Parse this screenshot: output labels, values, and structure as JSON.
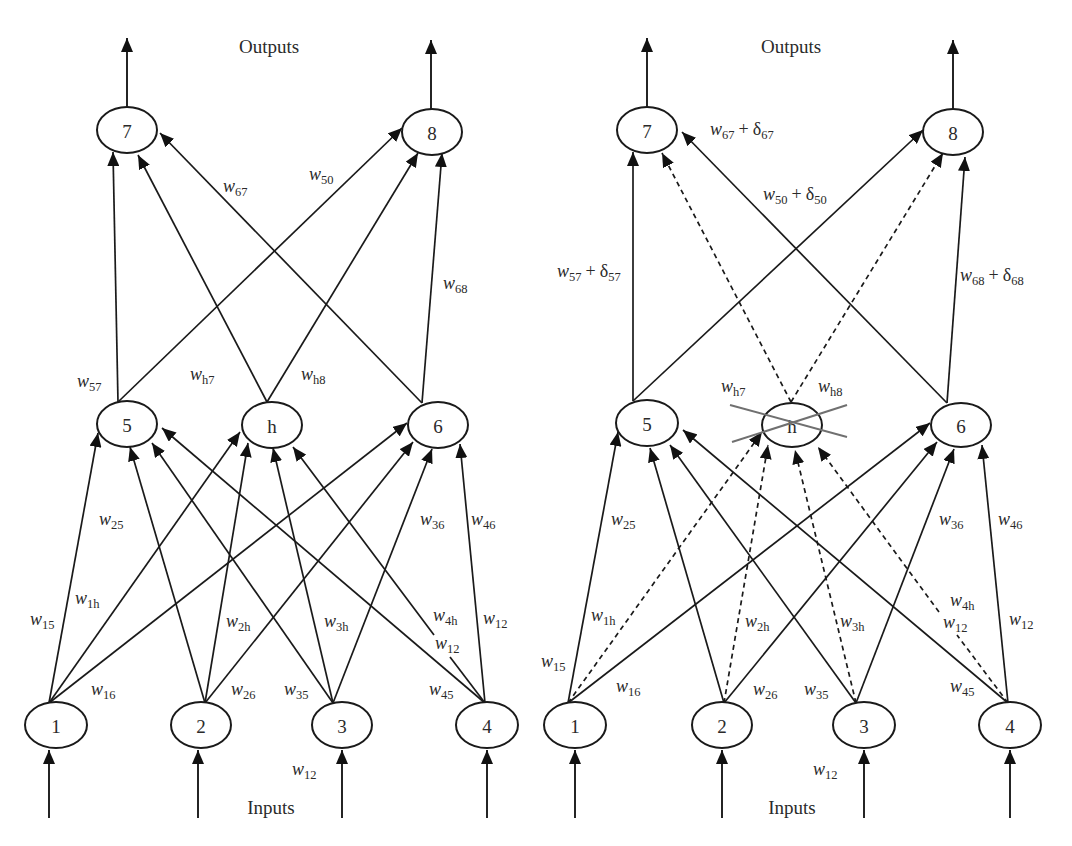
{
  "left": {
    "outputs_label": "Outputs",
    "inputs_label": "Inputs",
    "nodes": {
      "7": "7",
      "8": "8",
      "5": "5",
      "h": "h",
      "6": "6",
      "1": "1",
      "2": "2",
      "3": "3",
      "4": "4"
    },
    "weights": {
      "w67": {
        "v": "w",
        "s": "67"
      },
      "w50": {
        "v": "w",
        "s": "50"
      },
      "w68": {
        "v": "w",
        "s": "68"
      },
      "w57": {
        "v": "w",
        "s": "57"
      },
      "wh7": {
        "v": "w",
        "s": "h7"
      },
      "wh8": {
        "v": "w",
        "s": "h8"
      },
      "w25": {
        "v": "w",
        "s": "25"
      },
      "w36": {
        "v": "w",
        "s": "36"
      },
      "w46": {
        "v": "w",
        "s": "46"
      },
      "w1h": {
        "v": "w",
        "s": "1h"
      },
      "w15": {
        "v": "w",
        "s": "15"
      },
      "w2h": {
        "v": "w",
        "s": "2h"
      },
      "w3h": {
        "v": "w",
        "s": "3h"
      },
      "w4h": {
        "v": "w",
        "s": "4h"
      },
      "w12_a": {
        "v": "w",
        "s": "12"
      },
      "w12_b": {
        "v": "w",
        "s": "12"
      },
      "w16": {
        "v": "w",
        "s": "16"
      },
      "w26": {
        "v": "w",
        "s": "26"
      },
      "w35": {
        "v": "w",
        "s": "35"
      },
      "w45": {
        "v": "w",
        "s": "45"
      },
      "w12_c": {
        "v": "w",
        "s": "12"
      }
    },
    "edges": [
      {
        "from": "1",
        "to": "5",
        "style": "solid"
      },
      {
        "from": "1",
        "to": "h",
        "style": "solid"
      },
      {
        "from": "1",
        "to": "6",
        "style": "solid"
      },
      {
        "from": "2",
        "to": "5",
        "style": "solid"
      },
      {
        "from": "2",
        "to": "h",
        "style": "solid"
      },
      {
        "from": "2",
        "to": "6",
        "style": "solid"
      },
      {
        "from": "3",
        "to": "5",
        "style": "solid"
      },
      {
        "from": "3",
        "to": "h",
        "style": "solid"
      },
      {
        "from": "3",
        "to": "6",
        "style": "solid"
      },
      {
        "from": "4",
        "to": "5",
        "style": "solid"
      },
      {
        "from": "4",
        "to": "h",
        "style": "solid"
      },
      {
        "from": "4",
        "to": "6",
        "style": "solid"
      },
      {
        "from": "5",
        "to": "7",
        "style": "solid"
      },
      {
        "from": "5",
        "to": "8",
        "style": "solid"
      },
      {
        "from": "h",
        "to": "7",
        "style": "solid"
      },
      {
        "from": "h",
        "to": "8",
        "style": "solid"
      },
      {
        "from": "6",
        "to": "7",
        "style": "solid"
      },
      {
        "from": "6",
        "to": "8",
        "style": "solid"
      }
    ]
  },
  "right": {
    "outputs_label": "Outputs",
    "inputs_label": "Inputs",
    "pruned_node": "h",
    "cross_color": "#707070",
    "nodes": {
      "7": "7",
      "8": "8",
      "5": "5",
      "h": "h",
      "6": "6",
      "1": "1",
      "2": "2",
      "3": "3",
      "4": "4"
    },
    "weights": {
      "w67": {
        "v": "w",
        "s": "67",
        "op": "+",
        "d": "δ",
        "ds": "67"
      },
      "w50": {
        "v": "w",
        "s": "50",
        "op": "+",
        "d": "δ",
        "ds": "50"
      },
      "w57": {
        "v": "w",
        "s": "57",
        "op": "+",
        "d": "δ",
        "ds": "57"
      },
      "w68": {
        "v": "w",
        "s": "68",
        "op": "+",
        "d": "δ",
        "ds": "68"
      },
      "wh7": {
        "v": "w",
        "s": "h7"
      },
      "wh8": {
        "v": "w",
        "s": "h8"
      },
      "w25": {
        "v": "w",
        "s": "25"
      },
      "w36": {
        "v": "w",
        "s": "36"
      },
      "w46": {
        "v": "w",
        "s": "46"
      },
      "w1h": {
        "v": "w",
        "s": "1h"
      },
      "w15": {
        "v": "w",
        "s": "15"
      },
      "w2h": {
        "v": "w",
        "s": "2h"
      },
      "w3h": {
        "v": "w",
        "s": "3h"
      },
      "w4h": {
        "v": "w",
        "s": "4h"
      },
      "w12_a": {
        "v": "w",
        "s": "12"
      },
      "w12_b": {
        "v": "w",
        "s": "12"
      },
      "w16": {
        "v": "w",
        "s": "16"
      },
      "w26": {
        "v": "w",
        "s": "26"
      },
      "w35": {
        "v": "w",
        "s": "35"
      },
      "w45": {
        "v": "w",
        "s": "45"
      },
      "w12_c": {
        "v": "w",
        "s": "12"
      }
    },
    "edges": [
      {
        "from": "1",
        "to": "5",
        "style": "solid"
      },
      {
        "from": "1",
        "to": "h",
        "style": "dashed"
      },
      {
        "from": "1",
        "to": "6",
        "style": "solid"
      },
      {
        "from": "2",
        "to": "5",
        "style": "solid"
      },
      {
        "from": "2",
        "to": "h",
        "style": "dashed"
      },
      {
        "from": "2",
        "to": "6",
        "style": "solid"
      },
      {
        "from": "3",
        "to": "5",
        "style": "solid"
      },
      {
        "from": "3",
        "to": "h",
        "style": "dashed"
      },
      {
        "from": "3",
        "to": "6",
        "style": "solid"
      },
      {
        "from": "4",
        "to": "5",
        "style": "solid"
      },
      {
        "from": "4",
        "to": "h",
        "style": "dashed"
      },
      {
        "from": "4",
        "to": "6",
        "style": "solid"
      },
      {
        "from": "5",
        "to": "7",
        "style": "solid"
      },
      {
        "from": "5",
        "to": "8",
        "style": "solid"
      },
      {
        "from": "h",
        "to": "7",
        "style": "dashed"
      },
      {
        "from": "h",
        "to": "8",
        "style": "dashed"
      },
      {
        "from": "6",
        "to": "7",
        "style": "solid"
      },
      {
        "from": "6",
        "to": "8",
        "style": "solid"
      }
    ]
  }
}
